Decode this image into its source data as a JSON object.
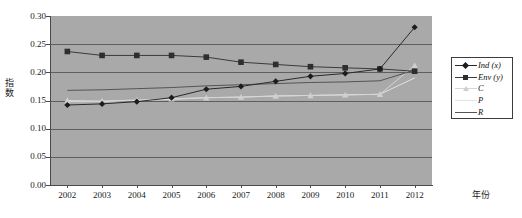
{
  "chart": {
    "type": "line",
    "y_axis_title": "指数",
    "x_axis_title": "年份",
    "y_ticks": [
      "0.30",
      "0.25",
      "0.20",
      "0.15",
      "0.10",
      "0.05",
      "0.00"
    ],
    "x_ticks": [
      "2002",
      "2003",
      "2004",
      "2005",
      "2006",
      "2007",
      "2008",
      "2009",
      "2010",
      "2011",
      "2012"
    ],
    "legend": [
      {
        "label": "Ind (x)",
        "marker": "diamond",
        "color": "#1c1c1c",
        "line_color": "#2a2a2a"
      },
      {
        "label": "Env (y)",
        "marker": "square",
        "color": "#2e2e2e",
        "line_color": "#3a3a3a"
      },
      {
        "label": "C",
        "marker": "triangle",
        "color": "#cfcfcf",
        "line_color": "#d6d6d6"
      },
      {
        "label": "P",
        "marker": "none",
        "color": "#e6e6e6",
        "line_color": "#e2e2e2"
      },
      {
        "label": "R",
        "marker": "none",
        "color": "#555555",
        "line_color": "#555555"
      }
    ]
  },
  "chart_data": {
    "type": "line",
    "title": "",
    "xlabel": "年份",
    "ylabel": "指数",
    "ylim": [
      0.0,
      0.3
    ],
    "ytick_values": [
      0.3,
      0.25,
      0.2,
      0.15,
      0.1,
      0.05,
      0.0
    ],
    "grid": true,
    "legend_position": "right",
    "categories": [
      "2002",
      "2003",
      "2004",
      "2005",
      "2006",
      "2007",
      "2008",
      "2009",
      "2010",
      "2011",
      "2012"
    ],
    "series": [
      {
        "name": "Ind (x)",
        "marker": "diamond",
        "values": [
          0.142,
          0.144,
          0.148,
          0.155,
          0.17,
          0.175,
          0.184,
          0.193,
          0.198,
          0.206,
          0.28
        ]
      },
      {
        "name": "Env (y)",
        "marker": "square",
        "values": [
          0.237,
          0.23,
          0.23,
          0.23,
          0.227,
          0.218,
          0.214,
          0.21,
          0.208,
          0.206,
          0.202
        ]
      },
      {
        "name": "C",
        "marker": "triangle",
        "values": [
          0.15,
          0.149,
          0.151,
          0.153,
          0.155,
          0.156,
          0.158,
          0.159,
          0.16,
          0.161,
          0.212
        ]
      },
      {
        "name": "P",
        "marker": "none",
        "values": [
          0.148,
          0.148,
          0.15,
          0.152,
          0.155,
          0.156,
          0.158,
          0.159,
          0.16,
          0.161,
          0.19
        ]
      },
      {
        "name": "R",
        "marker": "none",
        "values": [
          0.168,
          0.169,
          0.171,
          0.173,
          0.176,
          0.178,
          0.18,
          0.182,
          0.183,
          0.185,
          0.204
        ]
      }
    ]
  }
}
